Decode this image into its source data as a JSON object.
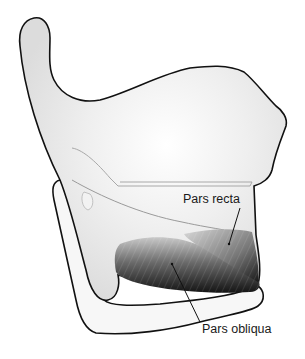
{
  "figure": {
    "colors": {
      "background": "#ffffff",
      "cartilage_fill": "#f6f6f6",
      "cartilage_shadow": "#d9d9d9",
      "outline": "#111111",
      "muscle_dark": "#1c1c1c",
      "muscle_mid": "#6a6a6a",
      "muscle_light": "#b8b8b8"
    },
    "labels": [
      {
        "id": "pars-recta",
        "text": "Pars recta"
      },
      {
        "id": "pars-obliqua",
        "text": "Pars obliqua"
      }
    ]
  }
}
